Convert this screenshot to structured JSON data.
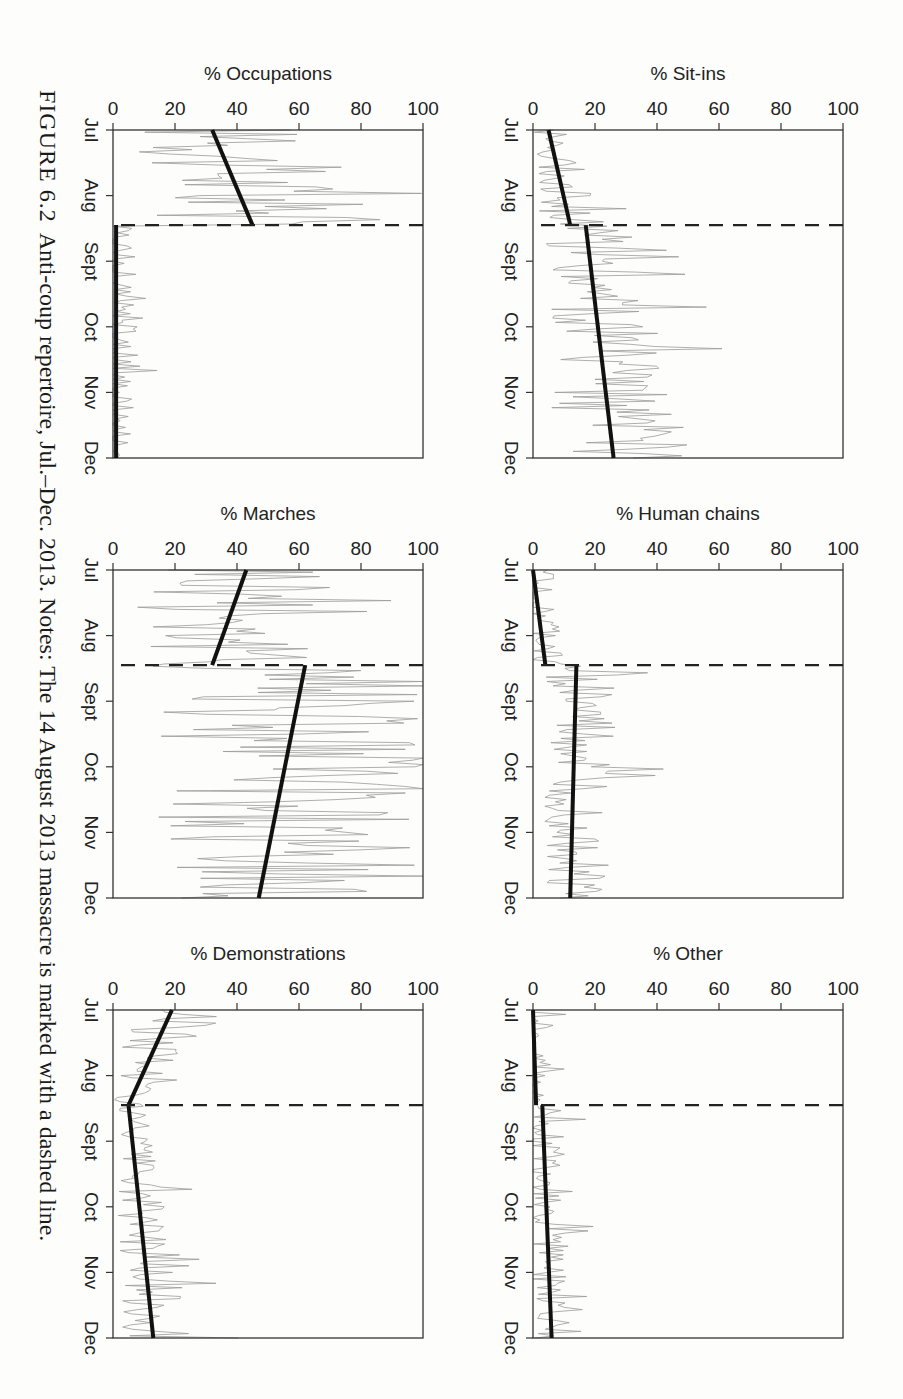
{
  "figure": {
    "label": "FIGURE 6.2",
    "caption": "Anti-coup repertoire, Jul.–Dec. 2013. Notes: The 14 August 2013 massacre is marked with a dashed line."
  },
  "chart_data": [
    {
      "type": "line",
      "title": "",
      "ylabel": "% Occupations",
      "xlabel": "",
      "x_ticks": [
        "Jul",
        "Aug",
        "Sept",
        "Oct",
        "Nov",
        "Dec"
      ],
      "y_ticks": [
        0,
        20,
        40,
        60,
        80,
        100
      ],
      "ylim": [
        0,
        100
      ],
      "event_marker": {
        "label": "14 August 2013 massacre",
        "style": "dashed",
        "x_fraction": 0.29
      },
      "trend_segments": [
        {
          "from": {
            "x": 0.0,
            "y": 32
          },
          "to": {
            "x": 0.29,
            "y": 45
          }
        },
        {
          "from": {
            "x": 0.29,
            "y": 1
          },
          "to": {
            "x": 1.0,
            "y": 1
          }
        }
      ],
      "series_description": "daily percent, noisy grey series; 20-75% before massacre, ~0 after"
    },
    {
      "type": "line",
      "ylabel": "% Marches",
      "x_ticks": [
        "Jul",
        "Aug",
        "Sept",
        "Oct",
        "Nov",
        "Dec"
      ],
      "y_ticks": [
        0,
        20,
        40,
        60,
        80,
        100
      ],
      "ylim": [
        0,
        100
      ],
      "event_marker": {
        "label": "14 August 2013 massacre",
        "style": "dashed",
        "x_fraction": 0.29
      },
      "trend_segments": [
        {
          "from": {
            "x": 0.0,
            "y": 43
          },
          "to": {
            "x": 0.29,
            "y": 32
          }
        },
        {
          "from": {
            "x": 0.29,
            "y": 62
          },
          "to": {
            "x": 1.0,
            "y": 47
          }
        }
      ],
      "series_description": "daily percent, noisy grey series; 15-70% before, 20-100% after"
    },
    {
      "type": "line",
      "ylabel": "% Demonstrations",
      "x_ticks": [
        "Jul",
        "Aug",
        "Sept",
        "Oct",
        "Nov",
        "Dec"
      ],
      "y_ticks": [
        0,
        20,
        40,
        60,
        80,
        100
      ],
      "ylim": [
        0,
        100
      ],
      "event_marker": {
        "label": "14 August 2013 massacre",
        "style": "dashed",
        "x_fraction": 0.29
      },
      "trend_segments": [
        {
          "from": {
            "x": 0.0,
            "y": 19
          },
          "to": {
            "x": 0.29,
            "y": 5
          }
        },
        {
          "from": {
            "x": 0.29,
            "y": 5
          },
          "to": {
            "x": 1.0,
            "y": 13
          }
        }
      ],
      "series_description": "daily percent; one spike to ~100% in late Oct"
    },
    {
      "type": "line",
      "ylabel": "% Sit-ins",
      "x_ticks": [
        "Jul",
        "Aug",
        "Sept",
        "Oct",
        "Nov",
        "Dec"
      ],
      "y_ticks": [
        0,
        20,
        40,
        60,
        80,
        100
      ],
      "ylim": [
        0,
        100
      ],
      "event_marker": {
        "label": "14 August 2013 massacre",
        "style": "dashed",
        "x_fraction": 0.29
      },
      "trend_segments": [
        {
          "from": {
            "x": 0.0,
            "y": 5
          },
          "to": {
            "x": 0.29,
            "y": 12
          }
        },
        {
          "from": {
            "x": 0.29,
            "y": 17
          },
          "to": {
            "x": 1.0,
            "y": 26
          }
        }
      ],
      "series_description": "daily percent; one spike to ~100% in early Nov"
    },
    {
      "type": "line",
      "ylabel": "% Human chains",
      "x_ticks": [
        "Jul",
        "Aug",
        "Sept",
        "Oct",
        "Nov",
        "Dec"
      ],
      "y_ticks": [
        0,
        20,
        40,
        60,
        80,
        100
      ],
      "ylim": [
        0,
        100
      ],
      "event_marker": {
        "label": "14 August 2013 massacre",
        "style": "dashed",
        "x_fraction": 0.29
      },
      "trend_segments": [
        {
          "from": {
            "x": 0.0,
            "y": 0
          },
          "to": {
            "x": 0.29,
            "y": 4
          }
        },
        {
          "from": {
            "x": 0.29,
            "y": 14
          },
          "to": {
            "x": 1.0,
            "y": 12
          }
        }
      ],
      "series_description": "daily percent; peak ~75% in mid Sept"
    },
    {
      "type": "line",
      "ylabel": "% Other",
      "x_ticks": [
        "Jul",
        "Aug",
        "Sept",
        "Oct",
        "Nov",
        "Dec"
      ],
      "y_ticks": [
        0,
        20,
        40,
        60,
        80,
        100
      ],
      "ylim": [
        0,
        100
      ],
      "event_marker": {
        "label": "14 August 2013 massacre",
        "style": "dashed",
        "x_fraction": 0.29
      },
      "trend_segments": [
        {
          "from": {
            "x": 0.0,
            "y": 0
          },
          "to": {
            "x": 0.29,
            "y": 1
          }
        },
        {
          "from": {
            "x": 0.29,
            "y": 3
          },
          "to": {
            "x": 1.0,
            "y": 6
          }
        }
      ],
      "series_description": "daily percent; spikes to ~50% mid Aug, ~38% late Sept"
    }
  ],
  "layout_order": [
    "% Occupations",
    "% Marches",
    "% Demonstrations",
    "% Sit-ins",
    "% Human chains",
    "% Other"
  ]
}
